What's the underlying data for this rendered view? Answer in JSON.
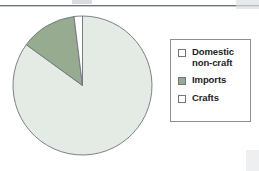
{
  "figure": {
    "type": "pie-chart-figure",
    "background_color": "#ffffff"
  },
  "legend": {
    "position": "right",
    "border_color": "#8b9097",
    "items": [
      {
        "label": "Domestic\nnon-craft",
        "swatch_name": "legend-swatch-domestic-non-craft",
        "color": "#ffffff",
        "filled": false
      },
      {
        "label": "Imports",
        "swatch_name": "legend-swatch-imports",
        "color": "#96ab90",
        "filled": true
      },
      {
        "label": "Crafts",
        "swatch_name": "legend-swatch-crafts",
        "color": "#ffffff",
        "filled": false
      }
    ]
  },
  "chart_data": {
    "type": "pie",
    "title": "",
    "subtitle": "",
    "xlabel": "",
    "ylabel": "",
    "grid": false,
    "legend_position": "right",
    "start_angle_deg": 0,
    "direction": "clockwise",
    "center_px": [
      82,
      85
    ],
    "radius_px": 70,
    "labels": [
      "Domestic non-craft",
      "Imports",
      "Crafts"
    ],
    "values": [
      85,
      13,
      2
    ],
    "units": "percent",
    "slices": [
      {
        "label": "Domestic non-craft",
        "value": 85,
        "percent": 85,
        "start_angle_deg": 0,
        "end_angle_deg": 306,
        "color": "#e4eae4",
        "edge_color": "#6f747a"
      },
      {
        "label": "Imports",
        "value": 13,
        "percent": 13,
        "start_angle_deg": 306,
        "end_angle_deg": 353,
        "color": "#96ab90",
        "edge_color": "#6f747a"
      },
      {
        "label": "Crafts",
        "value": 2,
        "percent": 2,
        "start_angle_deg": 353,
        "end_angle_deg": 360,
        "color": "#ffffff",
        "edge_color": "#6f747a"
      }
    ]
  }
}
